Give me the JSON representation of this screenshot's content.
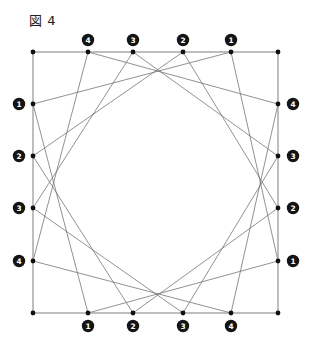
{
  "figure": {
    "caption": "図 4",
    "caption_name": "figure-caption",
    "type": "geometric-diagram",
    "colors": {
      "background": "#ffffff",
      "frame_stroke": "#8a8a8a",
      "chord_stroke": "#6e6e6e",
      "node_fill": "#101010",
      "badge_fill": "#141414",
      "badge_text": "#ffffff",
      "caption_text": "#202020"
    },
    "square": {
      "left": 33,
      "top": 52,
      "right": 278,
      "bottom": 313
    },
    "corners": [
      {
        "name": "top-left",
        "x": 33,
        "y": 52
      },
      {
        "name": "top-right",
        "x": 278,
        "y": 52
      },
      {
        "name": "bottom-right",
        "x": 278,
        "y": 313
      },
      {
        "name": "bottom-left",
        "x": 33,
        "y": 313
      }
    ],
    "sides": [
      {
        "id": "top",
        "label_position": "above",
        "label_order": "right-to-left",
        "points": [
          {
            "label": "4",
            "x": 88,
            "y": 52,
            "badge_x": 88,
            "badge_y": 40
          },
          {
            "label": "3",
            "x": 133,
            "y": 52,
            "badge_x": 133,
            "badge_y": 40
          },
          {
            "label": "2",
            "x": 183,
            "y": 52,
            "badge_x": 183,
            "badge_y": 40
          },
          {
            "label": "1",
            "x": 231,
            "y": 52,
            "badge_x": 231,
            "badge_y": 40
          }
        ]
      },
      {
        "id": "right",
        "label_position": "right",
        "label_order": "top-to-bottom",
        "points": [
          {
            "label": "4",
            "x": 278,
            "y": 104,
            "badge_x": 293,
            "badge_y": 104
          },
          {
            "label": "3",
            "x": 278,
            "y": 156,
            "badge_x": 293,
            "badge_y": 156
          },
          {
            "label": "2",
            "x": 278,
            "y": 208,
            "badge_x": 293,
            "badge_y": 208
          },
          {
            "label": "1",
            "x": 278,
            "y": 261,
            "badge_x": 293,
            "badge_y": 261
          }
        ]
      },
      {
        "id": "bottom",
        "label_position": "below",
        "label_order": "left-to-right",
        "points": [
          {
            "label": "1",
            "x": 88,
            "y": 313,
            "badge_x": 88,
            "badge_y": 326
          },
          {
            "label": "2",
            "x": 133,
            "y": 313,
            "badge_x": 133,
            "badge_y": 326
          },
          {
            "label": "3",
            "x": 183,
            "y": 313,
            "badge_x": 183,
            "badge_y": 326
          },
          {
            "label": "4",
            "x": 231,
            "y": 313,
            "badge_x": 231,
            "badge_y": 326
          }
        ]
      },
      {
        "id": "left",
        "label_position": "left",
        "label_order": "top-to-bottom",
        "points": [
          {
            "label": "1",
            "x": 33,
            "y": 104,
            "badge_x": 19,
            "badge_y": 104
          },
          {
            "label": "2",
            "x": 33,
            "y": 156,
            "badge_x": 19,
            "badge_y": 156
          },
          {
            "label": "3",
            "x": 33,
            "y": 208,
            "badge_x": 19,
            "badge_y": 208
          },
          {
            "label": "4",
            "x": 33,
            "y": 261,
            "badge_x": 19,
            "badge_y": 261
          }
        ]
      }
    ],
    "corner_dots": [
      {
        "x": 33,
        "y": 52
      },
      {
        "x": 278,
        "y": 52
      },
      {
        "x": 278,
        "y": 313
      },
      {
        "x": 33,
        "y": 313
      }
    ],
    "chords": [
      {
        "x1": 88,
        "y1": 52,
        "x2": 33,
        "y2": 261
      },
      {
        "x1": 133,
        "y1": 52,
        "x2": 33,
        "y2": 208
      },
      {
        "x1": 183,
        "y1": 52,
        "x2": 33,
        "y2": 156
      },
      {
        "x1": 231,
        "y1": 52,
        "x2": 33,
        "y2": 104
      },
      {
        "x1": 278,
        "y1": 104,
        "x2": 88,
        "y2": 52
      },
      {
        "x1": 278,
        "y1": 156,
        "x2": 133,
        "y2": 52
      },
      {
        "x1": 278,
        "y1": 208,
        "x2": 183,
        "y2": 52
      },
      {
        "x1": 278,
        "y1": 261,
        "x2": 231,
        "y2": 52
      },
      {
        "x1": 231,
        "y1": 313,
        "x2": 278,
        "y2": 104
      },
      {
        "x1": 183,
        "y1": 313,
        "x2": 278,
        "y2": 156
      },
      {
        "x1": 133,
        "y1": 313,
        "x2": 278,
        "y2": 208
      },
      {
        "x1": 88,
        "y1": 313,
        "x2": 278,
        "y2": 261
      },
      {
        "x1": 33,
        "y1": 261,
        "x2": 231,
        "y2": 313
      },
      {
        "x1": 33,
        "y1": 208,
        "x2": 183,
        "y2": 313
      },
      {
        "x1": 33,
        "y1": 156,
        "x2": 133,
        "y2": 313
      },
      {
        "x1": 33,
        "y1": 104,
        "x2": 88,
        "y2": 313
      }
    ],
    "node_radius": 2.4,
    "badge_radius": 6.2
  }
}
